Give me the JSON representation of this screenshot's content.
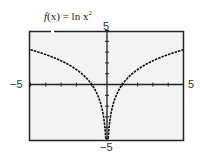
{
  "chart_data": {
    "type": "line",
    "function": "ln(x^2)",
    "xlim": [
      -5,
      5
    ],
    "ylim": [
      -5,
      5
    ],
    "xlabel": "",
    "ylabel": "",
    "tick_labels": {
      "x_min": "−5",
      "x_max": "5",
      "y_min": "−5",
      "y_max": "5"
    },
    "grid": false,
    "x": [
      -5,
      -4,
      -3,
      -2,
      -1,
      -0.5,
      -0.25,
      -0.1,
      0.1,
      0.25,
      0.5,
      1,
      2,
      3,
      4,
      5
    ],
    "y": [
      3.22,
      2.77,
      2.2,
      1.39,
      0,
      -1.39,
      -2.77,
      -4.61,
      -4.61,
      -2.77,
      -1.39,
      0,
      1.39,
      2.2,
      2.77,
      3.22
    ],
    "style": {
      "line": "dashed",
      "line_color": "#111111",
      "background": "#f3f3f3",
      "frame_color": "#222222"
    }
  },
  "labels": {
    "title_f": "f",
    "title_rest": "(x) = ln x",
    "title_sup": "2",
    "x_min": "−5",
    "x_max": "5",
    "y_max": "5",
    "y_min": "−5"
  }
}
